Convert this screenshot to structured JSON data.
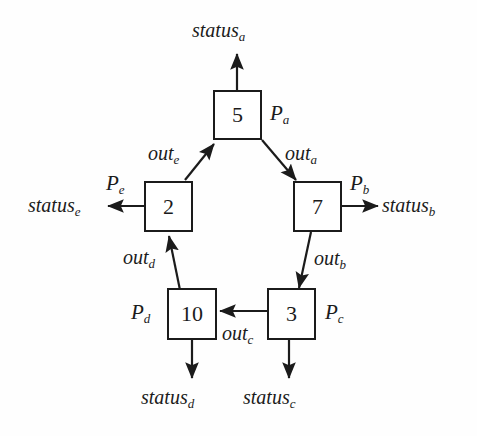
{
  "diagram": {
    "stroke_color": "#1b1b1b",
    "background_color": "#fefefe",
    "nodes": [
      {
        "id": "a",
        "value": "5",
        "process_label_base": "P",
        "process_label_sub": "a",
        "position": "top"
      },
      {
        "id": "b",
        "value": "7",
        "process_label_base": "P",
        "process_label_sub": "b",
        "position": "right"
      },
      {
        "id": "c",
        "value": "3",
        "process_label_base": "P",
        "process_label_sub": "c",
        "position": "bottom-right"
      },
      {
        "id": "d",
        "value": "10",
        "process_label_base": "P",
        "process_label_sub": "d",
        "position": "bottom-left"
      },
      {
        "id": "e",
        "value": "2",
        "process_label_base": "P",
        "process_label_sub": "e",
        "position": "left"
      }
    ],
    "edges": [
      {
        "id": "out_a",
        "label_base": "out",
        "label_sub": "a",
        "from": "a",
        "to": "b"
      },
      {
        "id": "out_b",
        "label_base": "out",
        "label_sub": "b",
        "from": "b",
        "to": "c"
      },
      {
        "id": "out_c",
        "label_base": "out",
        "label_sub": "c",
        "from": "c",
        "to": "d"
      },
      {
        "id": "out_d",
        "label_base": "out",
        "label_sub": "d",
        "from": "d",
        "to": "e"
      },
      {
        "id": "out_e",
        "label_base": "out",
        "label_sub": "e",
        "from": "e",
        "to": "a"
      }
    ],
    "status_outputs": [
      {
        "id": "status_a",
        "label_base": "status",
        "label_sub": "a",
        "from": "a",
        "direction": "up"
      },
      {
        "id": "status_b",
        "label_base": "status",
        "label_sub": "b",
        "from": "b",
        "direction": "right"
      },
      {
        "id": "status_c",
        "label_base": "status",
        "label_sub": "c",
        "from": "c",
        "direction": "down"
      },
      {
        "id": "status_d",
        "label_base": "status",
        "label_sub": "d",
        "from": "d",
        "direction": "down"
      },
      {
        "id": "status_e",
        "label_base": "status",
        "label_sub": "e",
        "from": "e",
        "direction": "left"
      }
    ]
  }
}
